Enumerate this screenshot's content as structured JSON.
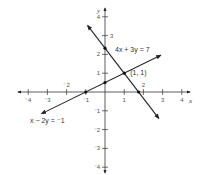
{
  "chart_data": {
    "type": "line",
    "title": "",
    "xlabel": "x",
    "ylabel": "y",
    "xlim": [
      -4,
      4
    ],
    "ylim": [
      -4,
      4
    ],
    "grid": false,
    "x_ticks": [
      {
        "value": -4,
        "label": "⁻4",
        "side": "below"
      },
      {
        "value": -3,
        "label": "⁻3",
        "side": "below"
      },
      {
        "value": -2,
        "label": "⁻2",
        "side": "above"
      },
      {
        "value": -1,
        "label": "⁻1",
        "side": "below"
      },
      {
        "value": 1,
        "label": "1",
        "side": "below"
      },
      {
        "value": 2,
        "label": "2",
        "side": "above"
      },
      {
        "value": 3,
        "label": "3",
        "side": "below"
      },
      {
        "value": 4,
        "label": "4",
        "side": "below"
      }
    ],
    "y_ticks": [
      {
        "value": 4,
        "label": "4",
        "side": "left"
      },
      {
        "value": 3,
        "label": "3",
        "side": "right"
      },
      {
        "value": 2,
        "label": "2",
        "side": "left"
      },
      {
        "value": 1,
        "label": "1",
        "side": "left"
      },
      {
        "value": -1,
        "label": "⁻1",
        "side": "left"
      },
      {
        "value": -2,
        "label": "⁻2",
        "side": "left"
      },
      {
        "value": -3,
        "label": "⁻3",
        "side": "left"
      },
      {
        "value": -4,
        "label": "⁻4",
        "side": "left"
      }
    ],
    "series": [
      {
        "name": "4x + 3y = 7",
        "label": "4x + 3y = 7",
        "x": [
          -0.9,
          2.8
        ],
        "y": [
          3.53,
          -1.4
        ],
        "marked_points": [
          [
            0,
            2.333
          ],
          [
            1.75,
            0
          ]
        ]
      },
      {
        "name": "x − 2y = ⁻1",
        "label": "x − 2y = ⁻1",
        "x": [
          -3.3,
          2.9
        ],
        "y": [
          -1.15,
          1.95
        ],
        "marked_points": [
          [
            -1,
            0
          ],
          [
            0,
            0.5
          ]
        ]
      }
    ],
    "annotations": [
      {
        "text": "(1, 1)",
        "x": 1,
        "y": 1,
        "marked": true
      }
    ]
  }
}
